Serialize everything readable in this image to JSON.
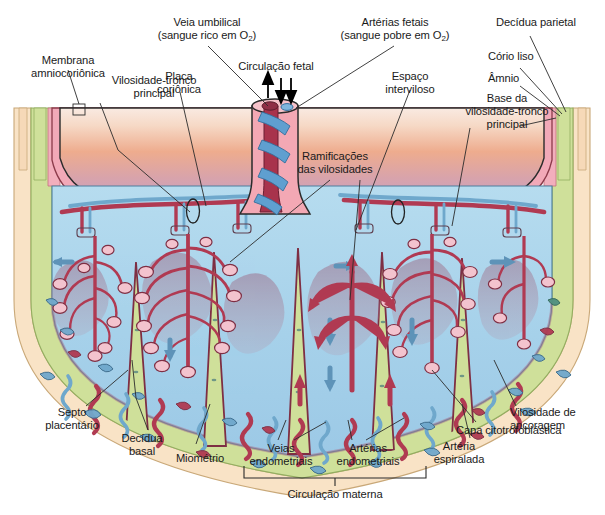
{
  "figure": {
    "caption_group": "Circulacao materna"
  },
  "labels": {
    "membrana_amniocorionica": "Membrana\namniocoriônica",
    "vilosidade_tronco_principal": "Vilosidade-tronco\nprincipal",
    "placa_corionica": "Placa\ncoriônica",
    "veia_umbilical_l1": "Veia umbilical",
    "veia_umbilical_l2_pre": "(sangue rico em O",
    "veia_umbilical_sub": "2",
    "veia_umbilical_l2_post": ")",
    "circulacao_fetal": "Circulação fetal",
    "arterias_fetais_l1": "Artérias fetais",
    "arterias_fetais_l2_pre": "(sangue pobre em O",
    "arterias_fetais_sub": "2",
    "arterias_fetais_l2_post": ")",
    "espaco_interviloso": "Espaço\ninterviloso",
    "decidua_parietal": "Decídua parietal",
    "corio_liso": "Cório liso",
    "amnio": "Âmnio",
    "base_vilosidade": "Base da\nvilosidade-tronco\nprincipal",
    "ramificacoes_vilosidades": "Ramificações\ndas vilosidades",
    "septo_placentario": "Septo\nplacentário",
    "decidua_basal": "Decídua\nbasal",
    "miometrio": "Miométrio",
    "veias_endometriais": "Veias\nendometriais",
    "arterias_endometriais": "Artérias\nendometriais",
    "arteria_espiralada": "Artéria\nespiralada",
    "capa_citotrofoblastica": "Capa citotrofoblástica",
    "vilosidade_ancoragem": "Vilosidade de\nancoragem",
    "circulacao_materna": "Circulação materna"
  },
  "colors": {
    "background": "#ffffff",
    "chorionic_plate_pink": "#f2a9b8",
    "chorionic_gradient_top": "#f6ded3",
    "chorionic_gradient_mid": "#eeab8c",
    "chorionic_gradient_bottom": "#c9a8c8",
    "intervillous_blue": "#a8d2ea",
    "decidua_green": "#cfe09a",
    "myometrium_cream": "#f8e3c8",
    "amnion_band": "#f2c8cf",
    "artery_red": "#b03a52",
    "vein_blue": "#6fa8cc",
    "cord_sheath_pink": "#f0a8b4",
    "umbilical_vein_red": "#a8334c",
    "umbilical_artery_blue": "#5f9fd0",
    "maternal_blood_mauve": "#a8788f",
    "leader_line": "#3a3a3a",
    "text": "#1a1a1a"
  },
  "anatomy": {
    "layers_outer_to_inner": [
      "Miométrio",
      "Decídua basal",
      "Espaço interviloso",
      "Placa coriônica",
      "Cório liso",
      "Âmnio"
    ],
    "cotyledon_count": 6,
    "septa_count": 5,
    "arrow_directions": {
      "umbilical_vein": "up",
      "umbilical_arteries": "down",
      "intervillous_inflow": "up",
      "intervillous_outflow": "down"
    }
  }
}
